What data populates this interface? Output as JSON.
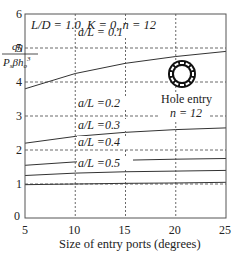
{
  "chart_data": {
    "type": "line",
    "title": "",
    "annotation_top": "L/D = 1.0, K = 0, n = 12",
    "ylabel": {
      "numerator": "qη",
      "denominator": "P_s β h_o^3"
    },
    "xlabel": "Size of entry ports (degrees)",
    "xlim": [
      5,
      25
    ],
    "ylim": [
      0,
      6
    ],
    "x_ticks": [
      5,
      10,
      15,
      20,
      25
    ],
    "y_ticks": [
      0,
      1,
      2,
      3,
      4,
      5,
      6
    ],
    "grid": true,
    "x": [
      5,
      10,
      15,
      20,
      25
    ],
    "series": [
      {
        "name": "a/L = 0.1",
        "values": [
          3.8,
          4.25,
          4.55,
          4.75,
          4.9
        ]
      },
      {
        "name": "a/L = 0.2",
        "values": [
          2.2,
          2.4,
          2.52,
          2.6,
          2.65
        ]
      },
      {
        "name": "a/L = 0.3",
        "values": [
          1.55,
          1.65,
          1.7,
          1.73,
          1.75
        ]
      },
      {
        "name": "a/L = 0.4",
        "values": [
          1.25,
          1.32,
          1.36,
          1.38,
          1.4
        ]
      },
      {
        "name": "a/L = 0.5",
        "values": [
          0.98,
          1.0,
          1.02,
          1.03,
          1.05
        ]
      }
    ],
    "inset": {
      "label": "Hole entry",
      "sublabel": "n = 12",
      "icon": "ring-with-holes-icon"
    }
  }
}
